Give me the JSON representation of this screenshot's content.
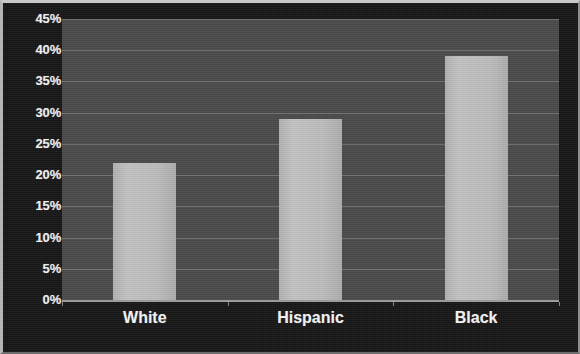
{
  "chart_data": {
    "type": "bar",
    "title": "",
    "subtitle": "",
    "xlabel": "",
    "ylabel": "",
    "categories": [
      "White",
      "Hispanic",
      "Black"
    ],
    "values": [
      22,
      29,
      39
    ],
    "value_labels": [
      "22%",
      "29%",
      "39%"
    ],
    "series": [
      {
        "name": "",
        "values": [
          22,
          29,
          39
        ]
      }
    ],
    "ylim": [
      0,
      45
    ],
    "ytick_step": 5,
    "ytick_labels": [
      "45%",
      "40%",
      "35%",
      "30%",
      "25%",
      "20%",
      "15%",
      "10%",
      "5%",
      "0%"
    ],
    "ytick_values": [
      45,
      40,
      35,
      30,
      25,
      20,
      15,
      10,
      5,
      0
    ],
    "grid": true,
    "grid_axis": "y",
    "legend": false,
    "legend_position": "none",
    "annotations": [],
    "colors": {
      "figure_background": "#171717",
      "plot_background": "#4b4b4b",
      "bar_fill": "#bcbcbc",
      "gridline": "#777777",
      "axis_line": "#9e9e9e",
      "tick_label": "#f2f2f2",
      "category_label": "#f5f5f5",
      "frame_border": "#c9c9c9"
    }
  }
}
